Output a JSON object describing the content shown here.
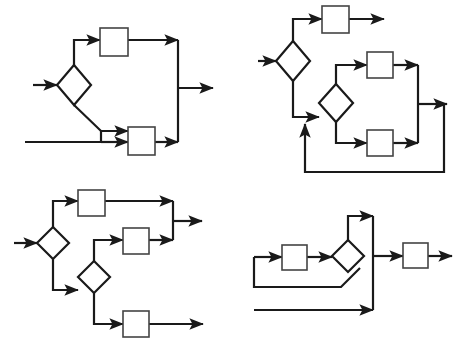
{
  "canvas": {
    "width": 464,
    "height": 347,
    "background": "#ffffff",
    "stroke_color": "#1a1a1a",
    "node_fill": "#ffffff",
    "node_stroke": "#444444",
    "line_width": 2.2,
    "thin_line_width": 1.6
  },
  "diagrams": [
    {
      "id": "diagram-top-left",
      "name": "flowchart-top-left",
      "decisions": 1,
      "processes": 2,
      "inputs": 2,
      "outputs": 1,
      "description": "One decision node splits into an upper branch through a process box and a lower branch that merges with a second external input before a second process box; both branches rejoin on a vertical bus and exit right.",
      "shapes": [
        {
          "type": "diamond",
          "name": "decision-1",
          "cx": 74,
          "cy": 85,
          "rx": 17,
          "ry": 20
        },
        {
          "type": "rect",
          "name": "process-1",
          "x": 100,
          "y": 28,
          "w": 28,
          "h": 28
        },
        {
          "type": "rect",
          "name": "process-2",
          "x": 128,
          "y": 127,
          "w": 27,
          "h": 28
        }
      ],
      "edges": [
        {
          "name": "input-arrow-1",
          "points": "33,85 57,85",
          "arrow": true
        },
        {
          "name": "input-arrow-2",
          "points": "25,142 101,142",
          "arrow": false
        },
        {
          "name": "decision-1-to-process-1",
          "points": "74,65 74,40 100,40",
          "arrow": true
        },
        {
          "name": "process-1-to-bus",
          "points": "128,40 178,40",
          "arrow": true
        },
        {
          "name": "decision-1-to-lower",
          "points": "74,105 101,131 128,131",
          "arrow": true
        },
        {
          "name": "input-2-join",
          "points": "101,142 101,131",
          "arrow": false
        },
        {
          "name": "lower-join-to-process-2",
          "points": "101,142 128,142",
          "arrow": true
        },
        {
          "name": "process-2-to-bus",
          "points": "155,142 178,142",
          "arrow": true
        },
        {
          "name": "bus-vertical",
          "points": "178,40 178,142",
          "arrow": false
        },
        {
          "name": "output-arrow-1",
          "points": "178,88 213,88",
          "arrow": true
        }
      ]
    },
    {
      "id": "diagram-top-right",
      "name": "flowchart-top-right",
      "decisions": 2,
      "processes": 3,
      "inputs": 1,
      "outputs": 2,
      "description": "A first decision sends one branch to a process box that exits right, and another branch down into a second decision; that decision fans out to two process boxes which merge on a vertical bus, producing an output and a feedback loop that returns to the second decision input.",
      "shapes": [
        {
          "type": "diamond",
          "name": "decision-1",
          "cx": 293,
          "cy": 61,
          "rx": 17,
          "ry": 20
        },
        {
          "type": "diamond",
          "name": "decision-2",
          "cx": 336,
          "cy": 103,
          "rx": 17,
          "ry": 19
        },
        {
          "type": "rect",
          "name": "process-1",
          "x": 322,
          "y": 6,
          "w": 27,
          "h": 27
        },
        {
          "type": "rect",
          "name": "process-2",
          "x": 367,
          "y": 52,
          "w": 26,
          "h": 26
        },
        {
          "type": "rect",
          "name": "process-3",
          "x": 367,
          "y": 130,
          "w": 26,
          "h": 26
        }
      ],
      "edges": [
        {
          "name": "input-arrow-1",
          "points": "258,61 276,61",
          "arrow": true
        },
        {
          "name": "decision-1-to-process-1",
          "points": "293,41 293,19 322,19",
          "arrow": true
        },
        {
          "name": "process-1-output",
          "points": "349,19 384,19",
          "arrow": true
        },
        {
          "name": "decision-1-to-decision-2",
          "points": "293,81 293,117 319,117",
          "arrow": true
        },
        {
          "name": "decision-2-to-process-2",
          "points": "336,84 336,65 367,65",
          "arrow": true
        },
        {
          "name": "process-2-to-bus",
          "points": "393,65 418,65",
          "arrow": true
        },
        {
          "name": "decision-2-to-process-3",
          "points": "336,122 336,143 367,143",
          "arrow": true
        },
        {
          "name": "process-3-to-bus",
          "points": "393,143 418,143",
          "arrow": true
        },
        {
          "name": "bus-vertical",
          "points": "418,65 418,143",
          "arrow": false
        },
        {
          "name": "output-arrow-1",
          "points": "418,104 447,104",
          "arrow": true
        },
        {
          "name": "feedback-loop",
          "points": "444,104 444,172 305,172 305,124",
          "arrow": true
        }
      ]
    },
    {
      "id": "diagram-bottom-left",
      "name": "flowchart-bottom-left",
      "decisions": 2,
      "processes": 3,
      "inputs": 1,
      "outputs": 2,
      "description": "A first decision branches up into a process box and down into a second decision; the second decision routes up to a middle process box that joins the first branch on a vertical bus for one output, and down to a third process box giving a separate output.",
      "shapes": [
        {
          "type": "diamond",
          "name": "decision-1",
          "cx": 53,
          "cy": 243,
          "rx": 16,
          "ry": 16
        },
        {
          "type": "diamond",
          "name": "decision-2",
          "cx": 94,
          "cy": 277,
          "rx": 16,
          "ry": 16
        },
        {
          "type": "rect",
          "name": "process-1",
          "x": 78,
          "y": 190,
          "w": 27,
          "h": 26
        },
        {
          "type": "rect",
          "name": "process-2",
          "x": 123,
          "y": 228,
          "w": 26,
          "h": 26
        },
        {
          "type": "rect",
          "name": "process-3",
          "x": 123,
          "y": 311,
          "w": 26,
          "h": 26
        }
      ],
      "edges": [
        {
          "name": "input-arrow-1",
          "points": "14,243 37,243",
          "arrow": true
        },
        {
          "name": "decision-1-to-process-1",
          "points": "53,227 53,201 78,201",
          "arrow": true
        },
        {
          "name": "process-1-to-bus",
          "points": "105,201 173,201",
          "arrow": true
        },
        {
          "name": "decision-1-to-decision-2",
          "points": "53,259 53,290 78,290",
          "arrow": true
        },
        {
          "name": "decision-2-to-process-2",
          "points": "94,261 94,240 123,240",
          "arrow": true
        },
        {
          "name": "process-2-to-bus",
          "points": "149,240 173,240",
          "arrow": true
        },
        {
          "name": "bus-vertical",
          "points": "173,201 173,240",
          "arrow": false
        },
        {
          "name": "output-arrow-1",
          "points": "173,221 202,221",
          "arrow": true
        },
        {
          "name": "decision-2-to-process-3",
          "points": "94,293 94,324 123,324",
          "arrow": true
        },
        {
          "name": "process-3-output",
          "points": "149,324 203,324",
          "arrow": true
        }
      ]
    },
    {
      "id": "diagram-bottom-right",
      "name": "flowchart-bottom-right",
      "decisions": 1,
      "processes": 2,
      "inputs": 2,
      "outputs": 1,
      "description": "An input feeds a process box then a decision; the decision loops back around the process box and also routes up over the top to a vertical bus, where a second bottom input also joins, before passing through a final process box to the output.",
      "shapes": [
        {
          "type": "diamond",
          "name": "decision-1",
          "cx": 348,
          "cy": 256,
          "rx": 16,
          "ry": 16
        },
        {
          "type": "rect",
          "name": "process-1",
          "x": 282,
          "y": 245,
          "w": 25,
          "h": 25
        },
        {
          "type": "rect",
          "name": "process-2",
          "x": 403,
          "y": 243,
          "w": 25,
          "h": 25
        }
      ],
      "edges": [
        {
          "name": "input-arrow-1",
          "points": "254,257 282,257",
          "arrow": true
        },
        {
          "name": "process-1-to-decision",
          "points": "307,257 332,257",
          "arrow": true
        },
        {
          "name": "decision-to-top-bus",
          "points": "348,240 348,216 373,216",
          "arrow": true
        },
        {
          "name": "decision-loopback",
          "points": "360,268 341,287 254,287 254,257",
          "arrow": false
        },
        {
          "name": "bus-vertical",
          "points": "373,216 373,310",
          "arrow": false
        },
        {
          "name": "input-arrow-2",
          "points": "254,310 373,310",
          "arrow": true
        },
        {
          "name": "bus-to-process-2",
          "points": "373,256 403,256",
          "arrow": true
        },
        {
          "name": "process-2-output",
          "points": "428,256 452,256",
          "arrow": true
        }
      ]
    }
  ]
}
